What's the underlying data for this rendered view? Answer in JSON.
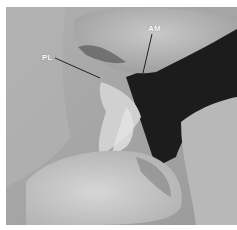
{
  "figure": {
    "type": "grayscale anatomical photograph",
    "labels": [
      {
        "text": "AM",
        "x": 148,
        "y": 24
      },
      {
        "text": "PL",
        "x": 42,
        "y": 53
      }
    ],
    "colors": {
      "background": "#a9a9a9",
      "tissue_light": "#d8d8d8",
      "shadow": "#1c1c1c",
      "label": "#ffffff",
      "leader_line": "#222222"
    }
  }
}
